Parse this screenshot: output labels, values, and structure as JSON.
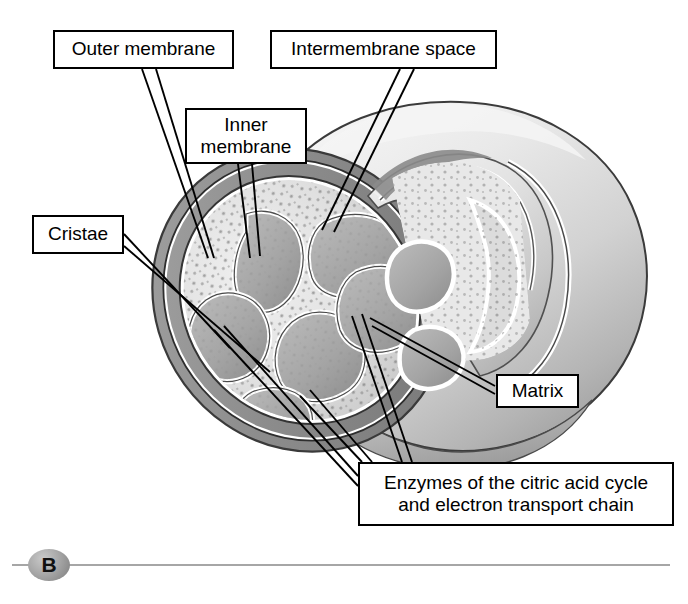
{
  "figure": {
    "panel_letter": "B"
  },
  "labels": {
    "outer_membrane": "Outer membrane",
    "intermembrane_space": "Intermembrane space",
    "inner_membrane": "Inner\nmembrane",
    "cristae": "Cristae",
    "matrix": "Matrix",
    "enzymes": "Enzymes of the citric acid cycle\nand electron transport chain"
  },
  "colors": {
    "line": "#000000",
    "box_fill": "#ffffff",
    "body_light": "#e6e6e6",
    "body_mid": "#cccccc",
    "body_shadow": "#9a9a9a",
    "cut_membrane": "#8f8f8f",
    "matrix_fill": "#e9e9e9",
    "crista_lumen": "#a9a9a9",
    "rule": "#a6a6a6",
    "marker": "#a0a0a0"
  }
}
